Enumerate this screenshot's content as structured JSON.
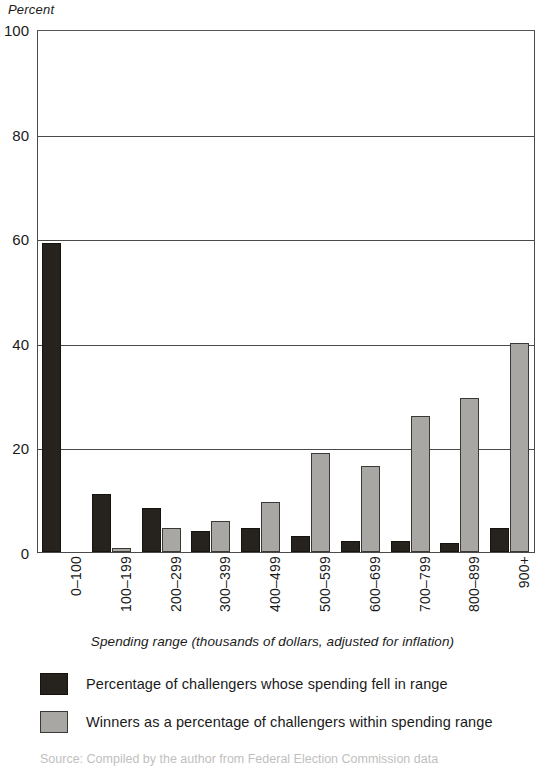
{
  "chart_data": {
    "type": "bar",
    "title": "",
    "xlabel": "Spending range (thousands of dollars, adjusted for inflation)",
    "ylabel": "Percent",
    "ylim": [
      0,
      100
    ],
    "yticks": [
      0,
      20,
      40,
      60,
      80,
      100
    ],
    "grid": true,
    "legend_position": "below",
    "categories": [
      "0–100",
      "100–199",
      "200–299",
      "300–399",
      "400–499",
      "500–599",
      "600–699",
      "700–799",
      "800–899",
      "900+"
    ],
    "series": [
      {
        "name": "Percentage of challengers whose spending fell in range",
        "color": "#26231f",
        "values": [
          59,
          11,
          8.5,
          4,
          4.5,
          3,
          2.2,
          2.2,
          1.7,
          4.5
        ]
      },
      {
        "name": "Winners as a percentage of challengers within spending range",
        "color": "#a9a7a4",
        "values": [
          0,
          0.7,
          4.5,
          6,
          9.5,
          19,
          16.5,
          26,
          29.5,
          40
        ]
      }
    ]
  },
  "axes": {
    "y_title": "Percent",
    "x_title": "Spending range (thousands of dollars, adjusted for inflation)",
    "y_tick_labels": [
      "0",
      "20",
      "40",
      "60",
      "80",
      "100"
    ]
  },
  "legend": {
    "items": [
      {
        "label": "Percentage of challengers whose spending fell in range",
        "swatch": "dark"
      },
      {
        "label": "Winners as a percentage of challengers within spending range",
        "swatch": "gray"
      }
    ]
  },
  "source_note": "Source: Compiled by the author from Federal Election Commission data"
}
